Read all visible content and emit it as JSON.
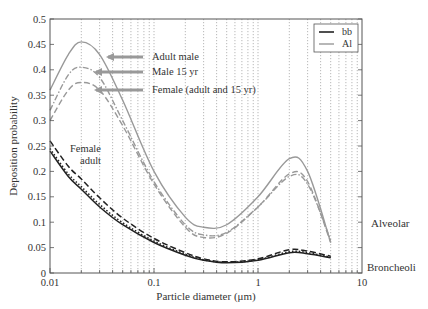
{
  "chart_data": {
    "type": "line",
    "title": "",
    "xlabel": "Particle diameter (μm)",
    "ylabel": "Deposition probability",
    "xscale": "log",
    "xlim": [
      0.01,
      10
    ],
    "ylim": [
      0,
      0.5
    ],
    "xticks": [
      0.01,
      0.1,
      1,
      10
    ],
    "xtick_labels": [
      "0.01",
      "0.1",
      "1",
      "10"
    ],
    "yticks": [
      0,
      0.05,
      0.1,
      0.15,
      0.2,
      0.25,
      0.3,
      0.35,
      0.4,
      0.45,
      0.5
    ],
    "ytick_labels": [
      "0",
      "0.05",
      "0.1",
      "0.15",
      "0.2",
      "0.25",
      "0.3",
      "0.35",
      "0.4",
      "0.45",
      "0.5"
    ],
    "grid": "vertical dotted at log minor ticks",
    "legend": {
      "position": "upper right",
      "entries": [
        {
          "label": "bb",
          "color": "#222222"
        },
        {
          "label": "Al",
          "color": "#999999"
        }
      ]
    },
    "right_labels": [
      {
        "text": "Alveolar",
        "y": 0.11
      },
      {
        "text": "Broncheoli",
        "y": 0.012
      }
    ],
    "annotations": [
      {
        "text": "Adult male",
        "arrow_to": [
          0.033,
          0.42
        ]
      },
      {
        "text": "Male 15 yr",
        "arrow_to": [
          0.028,
          0.395
        ]
      },
      {
        "text": "Female (adult and 15 yr)",
        "arrow_to": [
          0.028,
          0.36
        ]
      },
      {
        "text": "Female\nadult",
        "at": [
          0.025,
          0.23
        ]
      }
    ],
    "x": [
      0.01,
      0.015,
      0.02,
      0.03,
      0.05,
      0.1,
      0.2,
      0.3,
      0.5,
      1,
      2,
      3,
      5
    ],
    "series": [
      {
        "name": "Al Adult male",
        "group": "Al",
        "style": "solid",
        "color": "#999999",
        "values": [
          0.36,
          0.43,
          0.455,
          0.43,
          0.34,
          0.2,
          0.11,
          0.09,
          0.095,
          0.15,
          0.225,
          0.2,
          0.06
        ]
      },
      {
        "name": "Al Male 15 yr",
        "group": "Al",
        "style": "dashdot",
        "color": "#999999",
        "values": [
          0.32,
          0.39,
          0.405,
          0.385,
          0.3,
          0.18,
          0.095,
          0.075,
          0.08,
          0.13,
          0.19,
          0.175,
          0.065
        ]
      },
      {
        "name": "Al Female (adult and 15 yr)",
        "group": "Al",
        "style": "dashed",
        "color": "#999999",
        "values": [
          0.3,
          0.36,
          0.375,
          0.36,
          0.29,
          0.175,
          0.09,
          0.07,
          0.078,
          0.13,
          0.195,
          0.18,
          0.06
        ]
      },
      {
        "name": "bb Adult male",
        "group": "bb",
        "style": "solid",
        "color": "#222222",
        "values": [
          0.24,
          0.19,
          0.165,
          0.13,
          0.095,
          0.06,
          0.035,
          0.025,
          0.02,
          0.025,
          0.04,
          0.038,
          0.03
        ]
      },
      {
        "name": "bb Female adult",
        "group": "bb",
        "style": "dashed",
        "color": "#222222",
        "values": [
          0.26,
          0.21,
          0.185,
          0.148,
          0.108,
          0.068,
          0.04,
          0.028,
          0.022,
          0.028,
          0.046,
          0.043,
          0.033
        ]
      },
      {
        "name": "bb Male 15 yr",
        "group": "bb",
        "style": "dotted",
        "color": "#222222",
        "values": [
          0.245,
          0.195,
          0.17,
          0.135,
          0.099,
          0.063,
          0.037,
          0.026,
          0.021,
          0.026,
          0.042,
          0.04,
          0.031
        ]
      }
    ]
  },
  "labels": {
    "xlabel": "Particle diameter (μm)",
    "ylabel": "Deposition probability",
    "alveolar": "Alveolar",
    "broncheoli": "Broncheoli",
    "adult_male": "Adult male",
    "male_15": "Male 15 yr",
    "female": "Female (adult and 15 yr)",
    "female_adult_1": "Female",
    "female_adult_2": "adult",
    "legend_bb": "bb",
    "legend_al": "Al"
  }
}
